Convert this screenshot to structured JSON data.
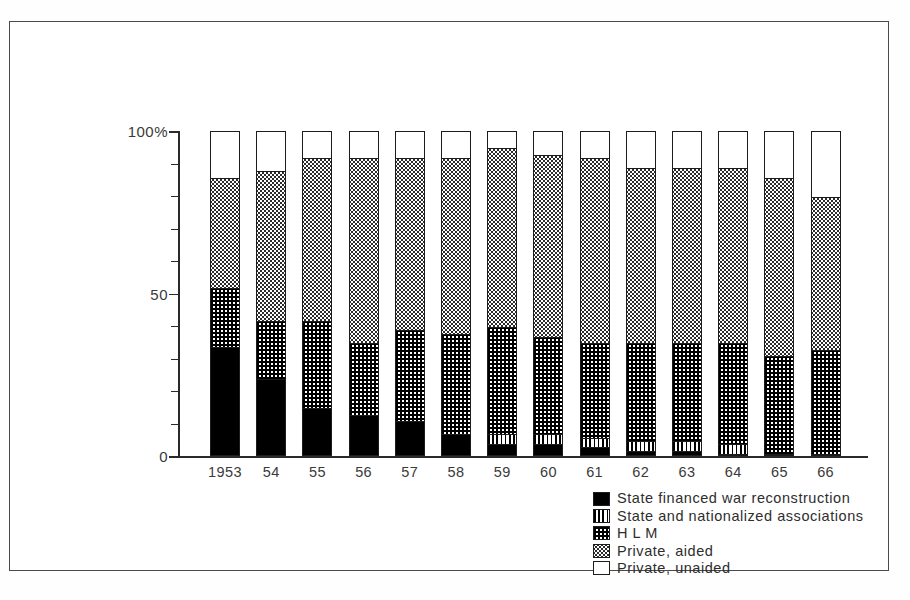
{
  "chart_data": {
    "type": "bar",
    "subtype": "stacked-percentage",
    "title": "",
    "xlabel": "",
    "ylabel": "",
    "ylim": [
      0,
      100
    ],
    "ytick_labels": [
      "0",
      "50",
      "100%"
    ],
    "ytick_values": [
      0,
      50,
      100
    ],
    "yminor_step": 10,
    "grid": false,
    "legend_position": "bottom-right",
    "categories": [
      "1953",
      "54",
      "55",
      "56",
      "57",
      "58",
      "59",
      "60",
      "61",
      "62",
      "63",
      "64",
      "65",
      "66"
    ],
    "series": [
      {
        "name": "State financed war reconstruction",
        "pattern": "solid-black",
        "values": [
          34,
          24,
          15,
          13,
          11,
          7,
          4,
          4,
          3,
          2,
          2,
          1,
          1,
          1
        ]
      },
      {
        "name": "State and nationalized associations",
        "pattern": "vertical-stripes",
        "values": [
          0,
          0,
          0,
          0,
          0,
          0,
          3,
          3,
          3,
          3,
          3,
          3,
          0,
          0
        ]
      },
      {
        "name": "H L M",
        "pattern": "checkerboard",
        "values": [
          18,
          18,
          27,
          22,
          28,
          31,
          33,
          30,
          29,
          30,
          30,
          31,
          30,
          32
        ]
      },
      {
        "name": "Private, aided",
        "pattern": "fine-dots",
        "values": [
          34,
          46,
          50,
          57,
          53,
          54,
          55,
          56,
          57,
          54,
          54,
          54,
          55,
          47
        ]
      },
      {
        "name": "Private, unaided",
        "pattern": "white",
        "values": [
          14,
          12,
          8,
          8,
          8,
          8,
          5,
          7,
          8,
          11,
          11,
          11,
          14,
          20
        ]
      }
    ],
    "legend_entries": [
      {
        "label": "State financed war reconstruction",
        "pattern": "solid-black"
      },
      {
        "label": "State and nationalized associations",
        "pattern": "vertical-stripes"
      },
      {
        "label": "H L M",
        "pattern": "checkerboard"
      },
      {
        "label": "Private, aided",
        "pattern": "fine-dots"
      },
      {
        "label": "Private, unaided",
        "pattern": "white"
      }
    ],
    "colors": {
      "axis": "#2a2a2a",
      "outline": "#1c1c1c",
      "text": "#3a3a3a",
      "background": "#ffffff",
      "frame": "#4a4a4a"
    }
  }
}
